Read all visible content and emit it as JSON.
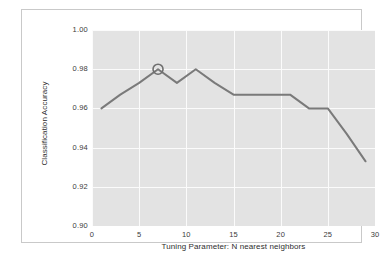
{
  "chart_data": {
    "type": "line",
    "title": "",
    "xlabel": "Tuning Parameter: N nearest neighbors",
    "ylabel": "Classification Accuracy",
    "xlim": [
      0,
      30
    ],
    "ylim": [
      0.9,
      1.0
    ],
    "xticks": [
      "0",
      "5",
      "10",
      "15",
      "20",
      "25",
      "30"
    ],
    "xtick_values": [
      0,
      5,
      10,
      15,
      20,
      25,
      30
    ],
    "yticks": [
      "0.90",
      "0.92",
      "0.94",
      "0.96",
      "0.98",
      "1.00"
    ],
    "ytick_values": [
      0.9,
      0.92,
      0.94,
      0.96,
      0.98,
      1.0
    ],
    "grid": true,
    "grid_color": "#fbfbfb",
    "plot_bgcolor": "#e3e3e3",
    "line_color": "#7a7a7a",
    "line_width": 2,
    "legend": "none",
    "series": [
      {
        "name": "Classification Accuracy",
        "x": [
          1,
          3,
          5,
          7,
          9,
          11,
          13,
          15,
          17,
          19,
          21,
          23,
          25,
          27,
          29
        ],
        "values": [
          0.96,
          0.967,
          0.973,
          0.98,
          0.973,
          0.98,
          0.973,
          0.967,
          0.967,
          0.967,
          0.967,
          0.96,
          0.96,
          0.947,
          0.933
        ]
      }
    ],
    "markers": [
      {
        "name": "best-k-highlight",
        "shape": "circle-open",
        "x": 7,
        "y": 0.98,
        "radius_px": 5,
        "color": "#6f6f6f"
      }
    ]
  },
  "figure": {
    "frame_color": "#c9c9c9",
    "background": "#ffffff"
  }
}
